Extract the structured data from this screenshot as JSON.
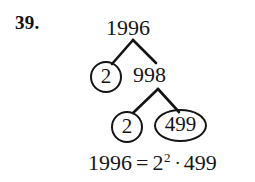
{
  "problem": {
    "number": "39."
  },
  "tree": {
    "root": {
      "value": "1996",
      "circled": false
    },
    "level2": [
      {
        "value": "2",
        "circled": true,
        "shape": "circle"
      },
      {
        "value": "998",
        "circled": false,
        "shape": "none"
      }
    ],
    "level3": [
      {
        "value": "2",
        "circled": true,
        "shape": "circle"
      },
      {
        "value": "499",
        "circled": true,
        "shape": "oval"
      }
    ]
  },
  "equation": {
    "left": "1996",
    "equals": "=",
    "base": "2",
    "exponent": "2",
    "dot": "·",
    "factor": "499",
    "full_text": "1996 = 2² · 499"
  },
  "style": {
    "ink": "#141414",
    "background": "#ffffff"
  }
}
